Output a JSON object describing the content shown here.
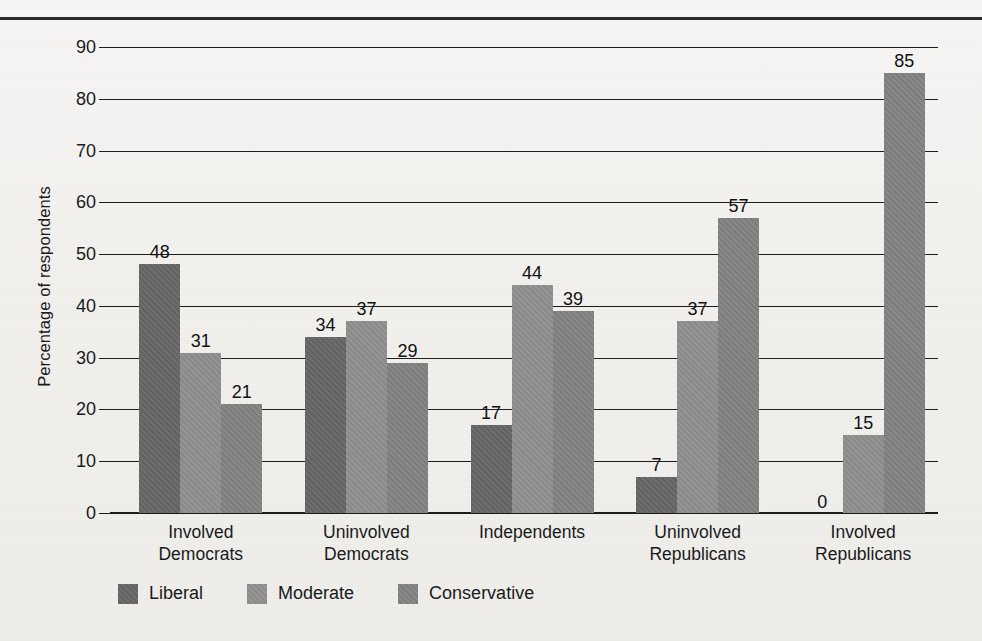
{
  "chart_data": {
    "type": "bar",
    "title": "",
    "xlabel": "",
    "ylabel": "Percentage of respondents",
    "ylim": [
      0,
      90
    ],
    "ytick_step": 10,
    "yticks": [
      "0",
      "10",
      "20",
      "30",
      "40",
      "50",
      "60",
      "70",
      "80",
      "90"
    ],
    "grid": true,
    "legend_position": "bottom-left",
    "categories": [
      "Involved\nDemocrats",
      "Uninvolved\nDemocrats",
      "Independents",
      "Uninvolved\nRepublicans",
      "Involved\nRepublicans"
    ],
    "series": [
      {
        "name": "Liberal",
        "color": "#656565",
        "values": [
          48,
          34,
          17,
          7,
          0
        ]
      },
      {
        "name": "Moderate",
        "color": "#8e8e8e",
        "values": [
          31,
          37,
          44,
          37,
          15
        ]
      },
      {
        "name": "Conservative",
        "color": "#818181",
        "values": [
          21,
          29,
          39,
          57,
          85
        ]
      }
    ],
    "data_labels": [
      [
        "48",
        "31",
        "21"
      ],
      [
        "34",
        "37",
        "29"
      ],
      [
        "17",
        "44",
        "39"
      ],
      [
        "7",
        "37",
        "57"
      ],
      [
        "0",
        "15",
        "85"
      ]
    ]
  },
  "legend": {
    "items": [
      {
        "label": "Liberal"
      },
      {
        "label": "Moderate"
      },
      {
        "label": "Conservative"
      }
    ]
  }
}
